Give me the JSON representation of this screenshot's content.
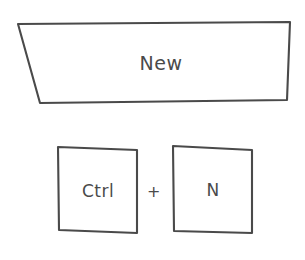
{
  "diagram": {
    "background_color": "#ffffff",
    "stroke_color": "#4a4a4a",
    "fill_color": "#ffffff",
    "style": "hand-drawn sketch"
  },
  "menu_item": {
    "label": "New",
    "shape": "trapezoid",
    "shape_points": "18,24 290,22 287,100 40,103"
  },
  "shortcut": {
    "separator": "+",
    "keys": [
      {
        "label": "Ctrl",
        "shape": "square",
        "shape_points": "58,147 137,150 137,233 59,230"
      },
      {
        "label": "N",
        "shape": "square",
        "shape_points": "173,146 252,150 252,233 174,231"
      }
    ]
  }
}
